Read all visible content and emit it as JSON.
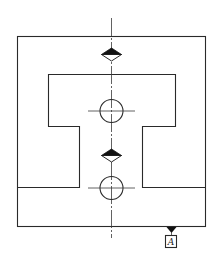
{
  "drawing": {
    "type": "engineering-drawing",
    "symbol": "symmetry-tolerance",
    "datum": {
      "label": "A"
    },
    "colors": {
      "stroke": "#2a2a2a",
      "background": "#ffffff"
    }
  }
}
